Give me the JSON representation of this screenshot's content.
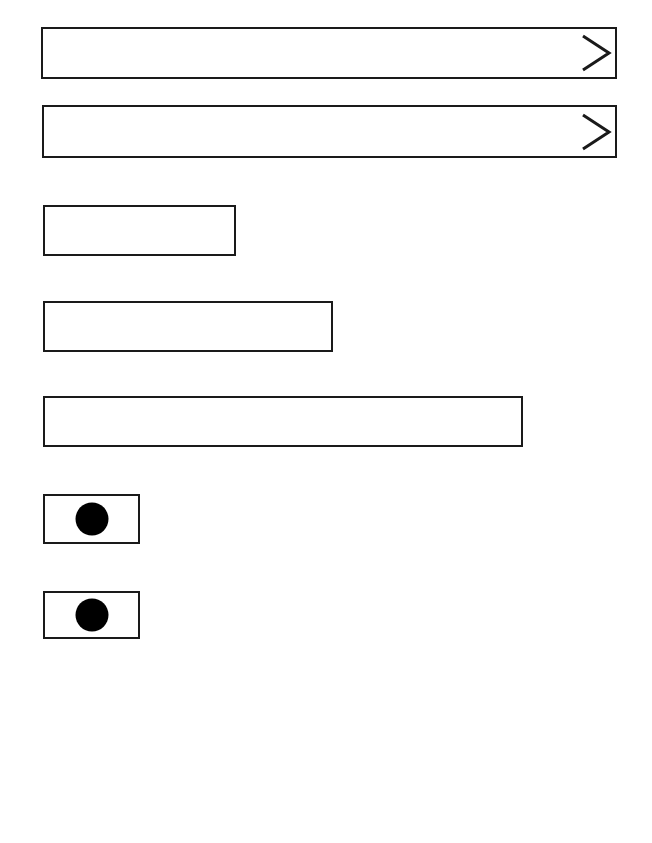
{
  "form": {
    "selects": [
      {
        "value": "",
        "icon": "chevron-right-icon"
      },
      {
        "value": "",
        "icon": "chevron-right-icon"
      }
    ],
    "text_fields": [
      {
        "value": "",
        "placeholder": ""
      },
      {
        "value": "",
        "placeholder": ""
      },
      {
        "value": "",
        "placeholder": ""
      }
    ],
    "radio_buttons": [
      {
        "selected": true
      },
      {
        "selected": true
      }
    ]
  },
  "colors": {
    "stroke": "#1a1a1a",
    "fill": "#000000",
    "background": "#ffffff"
  }
}
